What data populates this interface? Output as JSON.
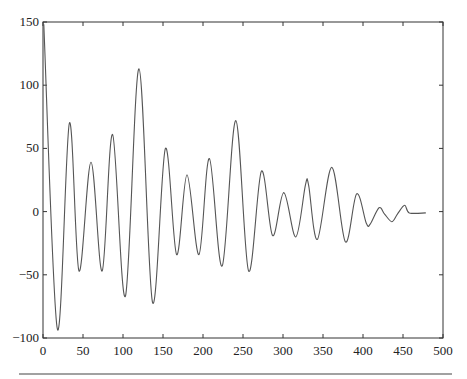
{
  "chart_data": {
    "type": "line",
    "title": "",
    "xlabel": "",
    "ylabel": "",
    "xlim": [
      0,
      500
    ],
    "ylim": [
      -100,
      150
    ],
    "grid": false,
    "legend": null,
    "x_ticks": [
      0,
      50,
      100,
      150,
      200,
      250,
      300,
      350,
      400,
      450,
      500
    ],
    "y_ticks": [
      150,
      100,
      50,
      0,
      -50,
      -100
    ],
    "x_tick_labels": [
      "0",
      "50",
      "100",
      "150",
      "200",
      "250",
      "300",
      "350",
      "400",
      "450",
      "500"
    ],
    "y_tick_labels": [
      "150",
      "100",
      "50",
      "0",
      "−50",
      "−100"
    ],
    "series": [
      {
        "name": "signal",
        "color": "#555555",
        "x": [
          1,
          18,
          33,
          45,
          60,
          74,
          87,
          103,
          120,
          137,
          153,
          167,
          180,
          195,
          208,
          224,
          241,
          257,
          273,
          287,
          301,
          316,
          328,
          332,
          343,
          361,
          378,
          392,
          404,
          409,
          420,
          427,
          436,
          443,
          452,
          458,
          478
        ],
        "y": [
          148,
          -93,
          70,
          -47,
          39,
          -47,
          61,
          -67,
          113,
          -72,
          50,
          -34,
          29,
          -34,
          42,
          -43,
          72,
          -47,
          32,
          -19,
          15,
          -20,
          21,
          21,
          -22,
          35,
          -24,
          14,
          -9,
          -10,
          3,
          -2,
          -8,
          -2,
          5,
          -1,
          -1
        ]
      }
    ]
  },
  "plot_frame": {
    "left_px": 43,
    "right_px": 443,
    "top_px": 22,
    "bottom_px": 338
  }
}
